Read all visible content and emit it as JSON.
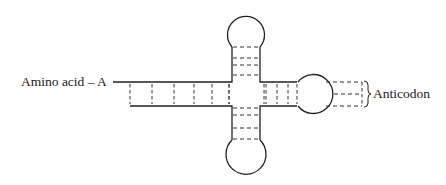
{
  "diagram": {
    "labels": {
      "amino_acid": "Amino acid – A",
      "anticodon": "Anticodon"
    },
    "colors": {
      "stroke": "#222222",
      "background": "#ffffff"
    },
    "arms": [
      {
        "name": "acceptor-stem",
        "base_pairs": 6
      },
      {
        "name": "top-arm",
        "base_pairs": 4
      },
      {
        "name": "bottom-arm",
        "base_pairs": 4
      },
      {
        "name": "anticodon-arm",
        "base_pairs": 4
      }
    ],
    "anticodon_bases": 3
  }
}
